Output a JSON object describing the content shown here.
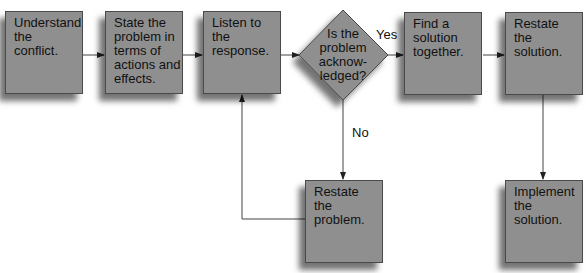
{
  "diagram": {
    "type": "flowchart",
    "colors": {
      "node_fill": "#8f8f8f",
      "node_border": "#4a4a4a",
      "line": "#333333",
      "text": "#111111"
    },
    "nodes": [
      {
        "id": "understand",
        "shape": "rect",
        "label": "Understand\nthe\nconflict."
      },
      {
        "id": "state",
        "shape": "rect",
        "label": "State the\nproblem in\nterms of\nactions and\neffects."
      },
      {
        "id": "listen",
        "shape": "rect",
        "label": "Listen to\nthe\nresponse."
      },
      {
        "id": "decision",
        "shape": "diamond",
        "label": "Is the\nproblem\nacknow-\nledged?"
      },
      {
        "id": "find",
        "shape": "rect",
        "label": "Find a\nsolution\ntogether."
      },
      {
        "id": "restate_solution",
        "shape": "rect",
        "label": "Restate\nthe\nsolution."
      },
      {
        "id": "restate_problem",
        "shape": "rect",
        "label": "Restate\nthe\nproblem."
      },
      {
        "id": "implement",
        "shape": "rect",
        "label": "Implement\nthe\nsolution."
      }
    ],
    "edges": [
      {
        "from": "understand",
        "to": "state",
        "label": ""
      },
      {
        "from": "state",
        "to": "listen",
        "label": ""
      },
      {
        "from": "listen",
        "to": "decision",
        "label": ""
      },
      {
        "from": "decision",
        "to": "find",
        "label": "Yes"
      },
      {
        "from": "find",
        "to": "restate_solution",
        "label": ""
      },
      {
        "from": "decision",
        "to": "restate_problem",
        "label": "No"
      },
      {
        "from": "restate_problem",
        "to": "listen",
        "label": ""
      },
      {
        "from": "restate_solution",
        "to": "implement",
        "label": ""
      }
    ]
  }
}
